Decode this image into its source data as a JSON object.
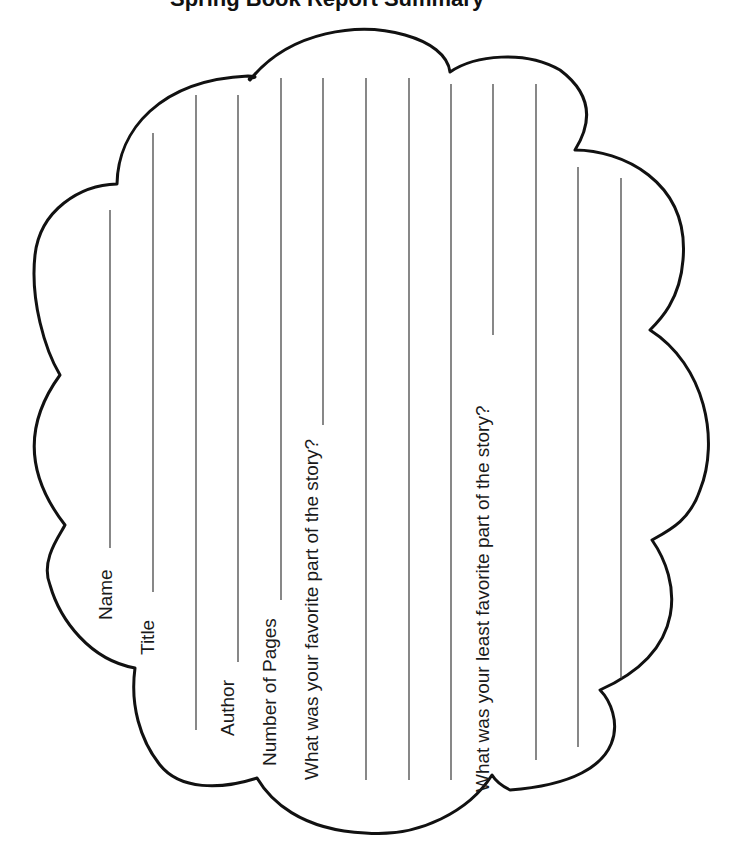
{
  "worksheet": {
    "title_cut_off": "Spring Book Report Summary",
    "orientation": "rotated-90-ccw",
    "shape": "cloud",
    "stroke_color": "#111111",
    "line_color": "#555555",
    "fields": [
      {
        "id": "name",
        "label": "Name"
      },
      {
        "id": "title",
        "label": "Title"
      },
      {
        "id": "author",
        "label": "Author"
      },
      {
        "id": "pages",
        "label": "Number of Pages"
      },
      {
        "id": "favorite",
        "label": "What was your favorite part of the story?"
      },
      {
        "id": "least_favorite",
        "label": "What was your least favorite part of the story?"
      }
    ],
    "writing_line_count": 13
  }
}
